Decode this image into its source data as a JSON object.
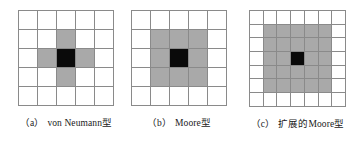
{
  "figure": {
    "colors": {
      "background": "#ffffff",
      "gridline": "#8a8a8a",
      "neighbor_fill": "#a9a9a9",
      "center_fill": "#0a0a0a"
    },
    "legend_meaning": {
      "black": "中心细胞",
      "gray": "邻居细胞",
      "white": "非邻居细胞"
    }
  },
  "panels": [
    {
      "id": "a",
      "tag": "（a）",
      "label": "von Neumann型",
      "grid": {
        "cols": 5,
        "rows": 5,
        "cell_px": 19,
        "cells": [
          [
            "white",
            "white",
            "white",
            "white",
            "white"
          ],
          [
            "white",
            "white",
            "gray",
            "white",
            "white"
          ],
          [
            "white",
            "gray",
            "black",
            "gray",
            "white"
          ],
          [
            "white",
            "white",
            "gray",
            "white",
            "white"
          ],
          [
            "white",
            "white",
            "white",
            "white",
            "white"
          ]
        ],
        "neighbor_count": 4
      }
    },
    {
      "id": "b",
      "tag": "（b）",
      "label": "Moore型",
      "grid": {
        "cols": 5,
        "rows": 5,
        "cell_px": 19,
        "cells": [
          [
            "white",
            "white",
            "white",
            "white",
            "white"
          ],
          [
            "white",
            "gray",
            "gray",
            "gray",
            "white"
          ],
          [
            "white",
            "gray",
            "black",
            "gray",
            "white"
          ],
          [
            "white",
            "gray",
            "gray",
            "gray",
            "white"
          ],
          [
            "white",
            "white",
            "white",
            "white",
            "white"
          ]
        ],
        "neighbor_count": 8
      }
    },
    {
      "id": "c",
      "tag": "（c）",
      "label": "扩展的Moore型",
      "grid": {
        "cols": 7,
        "rows": 7,
        "cell_px": 13.7,
        "cells": [
          [
            "white",
            "white",
            "white",
            "white",
            "white",
            "white",
            "white"
          ],
          [
            "white",
            "gray",
            "gray",
            "gray",
            "gray",
            "gray",
            "white"
          ],
          [
            "white",
            "gray",
            "gray",
            "gray",
            "gray",
            "gray",
            "white"
          ],
          [
            "white",
            "gray",
            "gray",
            "black",
            "gray",
            "gray",
            "white"
          ],
          [
            "white",
            "gray",
            "gray",
            "gray",
            "gray",
            "gray",
            "white"
          ],
          [
            "white",
            "gray",
            "gray",
            "gray",
            "gray",
            "gray",
            "white"
          ],
          [
            "white",
            "white",
            "white",
            "white",
            "white",
            "white",
            "white"
          ]
        ],
        "neighbor_count": 24
      }
    }
  ]
}
